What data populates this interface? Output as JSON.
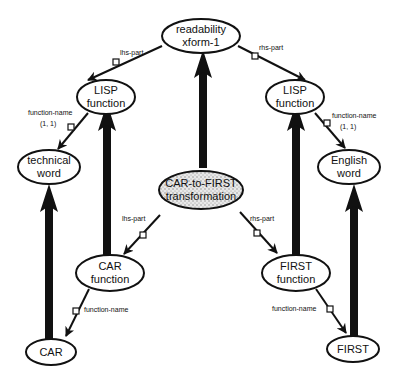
{
  "diagram": {
    "nodes": {
      "readability": {
        "line1": "readability",
        "line2": "xform-1"
      },
      "lisp_left": {
        "line1": "LISP",
        "line2": "function"
      },
      "lisp_right": {
        "line1": "LISP",
        "line2": "function"
      },
      "technical_word": {
        "line1": "technical",
        "line2": "word"
      },
      "english_word": {
        "line1": "English",
        "line2": "word"
      },
      "car_to_first": {
        "line1": "CAR-to-FIRST",
        "line2": "transformation"
      },
      "car_function": {
        "line1": "CAR",
        "line2": "function"
      },
      "first_function": {
        "line1": "FIRST",
        "line2": "function"
      },
      "car": {
        "line1": "CAR"
      },
      "first": {
        "line1": "FIRST"
      }
    },
    "edge_labels": {
      "top_lhs": "lhs-part",
      "top_rhs": "rhs-part",
      "left_fn_name": "function-name",
      "left_fn_card": "(1, 1)",
      "right_fn_name": "function-name",
      "right_fn_card": "(1, 1)",
      "mid_lhs": "lhs-part",
      "mid_rhs": "rhs-part",
      "car_fn_name": "function-name",
      "first_fn_name": "function-name"
    },
    "colors": {
      "stroke": "#111111",
      "background": "#ffffff",
      "stipple": "#bdbdbd"
    }
  }
}
